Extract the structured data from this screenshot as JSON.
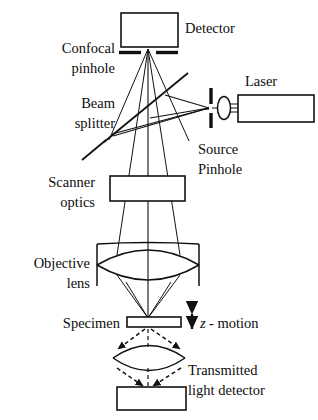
{
  "figure": {
    "background_color": "#ffffff",
    "ink_color": "#111111"
  },
  "labels": {
    "detector": "Detector",
    "confocal_pinhole_line1": "Confocal",
    "confocal_pinhole_line2": "pinhole",
    "beam_splitter_line1": "Beam",
    "beam_splitter_line2": "splitter",
    "laser": "Laser",
    "source_pinhole_line1": "Source",
    "source_pinhole_line2": "Pinhole",
    "scanner_optics_line1": "Scanner",
    "scanner_optics_line2": "optics",
    "objective_lens_line1": "Objective",
    "objective_lens_line2": "lens",
    "specimen": "Specimen",
    "z_motion_symbol": "z",
    "z_motion_text": "- motion",
    "transmitted_line1": "Transmitted",
    "transmitted_line2": "light detector"
  },
  "components": [
    {
      "name": "detector-box",
      "kind": "rectangle",
      "x": 121,
      "y": 13,
      "width": 57,
      "height": 34
    },
    {
      "name": "confocal-pinhole-left-bar",
      "kind": "bar",
      "x1": 120,
      "y1": 52,
      "x2": 141,
      "y2": 52
    },
    {
      "name": "confocal-pinhole-right-bar",
      "kind": "bar",
      "x1": 157,
      "y1": 52,
      "x2": 178,
      "y2": 52
    },
    {
      "name": "beam-splitter",
      "kind": "line",
      "x1": 105,
      "y1": 141,
      "x2": 187,
      "y2": 74
    },
    {
      "name": "source-pinhole-upper-bar",
      "kind": "bar",
      "x1": 211,
      "y1": 89,
      "x2": 211,
      "y2": 104
    },
    {
      "name": "source-pinhole-lower-bar",
      "kind": "bar",
      "x1": 211,
      "y1": 113,
      "x2": 211,
      "y2": 127
    },
    {
      "name": "laser-collimator-lens",
      "kind": "ellipse",
      "cx": 224,
      "cy": 108,
      "rx": 6,
      "ry": 11
    },
    {
      "name": "laser-box",
      "kind": "rectangle",
      "x": 238,
      "y": 95,
      "width": 76,
      "height": 27
    },
    {
      "name": "scanner-optics-box",
      "kind": "rectangle",
      "x": 110,
      "y": 176,
      "width": 75,
      "height": 25
    },
    {
      "name": "objective-lens",
      "kind": "biconvex-lens",
      "cx": 148,
      "cy": 264,
      "rx": 52,
      "ry": 21
    },
    {
      "name": "specimen-slide",
      "kind": "rectangle",
      "x": 127,
      "y": 317,
      "width": 54,
      "height": 10
    },
    {
      "name": "condenser-lens",
      "kind": "biconvex-lens",
      "cx": 149,
      "cy": 358,
      "rx": 36,
      "ry": 16
    },
    {
      "name": "transmitted-detector-box",
      "kind": "rectangle",
      "x": 117,
      "y": 387,
      "width": 69,
      "height": 23
    },
    {
      "name": "z-motion-arrow",
      "kind": "double-arrow",
      "x": 192,
      "y1": 311,
      "y2": 331
    }
  ],
  "optical_axis": {
    "x": 148,
    "y_top": 52,
    "y_bottom": 320
  }
}
